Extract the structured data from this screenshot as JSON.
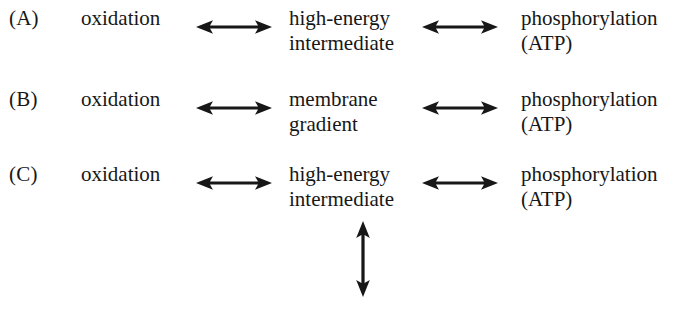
{
  "diagram": {
    "title": "",
    "background_color": "#ffffff",
    "ink_color": "#171717",
    "arrow_icon_name": "double-headed-arrow",
    "rows": [
      {
        "label": "(A)",
        "left_term": "oxidation",
        "middle_term_line1": "high-energy",
        "middle_term_line2": "intermediate",
        "right_term_line1": "phosphorylation",
        "right_term_line2": "(ATP)",
        "arrow1": "↔",
        "arrow2": "↔"
      },
      {
        "label": "(B)",
        "left_term": "oxidation",
        "middle_term_line1": "membrane",
        "middle_term_line2": "gradient",
        "right_term_line1": "phosphorylation",
        "right_term_line2": "(ATP)",
        "arrow1": "↔",
        "arrow2": "↔"
      },
      {
        "label": "(C)",
        "left_term": "oxidation",
        "middle_term_line1": "high-energy",
        "middle_term_line2": "intermediate",
        "right_term_line1": "phosphorylation",
        "right_term_line2": "(ATP)",
        "arrow1": "↔",
        "arrow2": "↔"
      }
    ],
    "vertical_arrow": {
      "glyph": "↕",
      "attached_to_row": "(C)",
      "attached_to_term": "high-energy intermediate"
    }
  }
}
